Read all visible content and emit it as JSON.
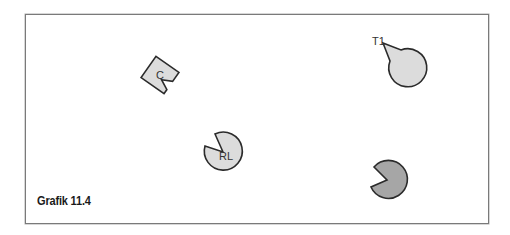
{
  "figure": {
    "caption": "Grafik 11.4",
    "colors": {
      "frame_border": "#7a7a7a",
      "light_fill": "#dcdcdc",
      "dark_fill": "#a6a6a6",
      "outline": "#2b2b2b"
    },
    "objects": [
      {
        "id": "C",
        "label": "C",
        "shape": "notched-square",
        "fill": "light",
        "cx": 160,
        "cy": 75
      },
      {
        "id": "T1",
        "label": "T1",
        "shape": "pac-circle",
        "fill": "light",
        "cx": 383,
        "cy": 43
      },
      {
        "id": "RL",
        "label": "RL",
        "shape": "pac-circle",
        "fill": "light",
        "cx": 223,
        "cy": 152
      },
      {
        "id": "unlabeled",
        "label": "",
        "shape": "pac-circle",
        "fill": "dark",
        "cx": 387,
        "cy": 180
      }
    ]
  }
}
